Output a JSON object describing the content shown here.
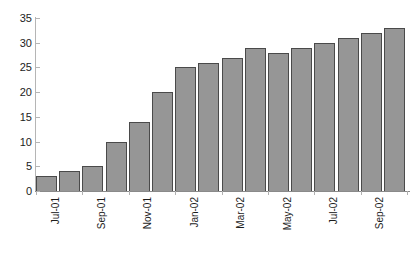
{
  "chart_data": {
    "type": "bar",
    "title": "",
    "subtitle": "",
    "xlabel": "",
    "ylabel": "",
    "categories": [
      "Jul-01",
      "Aug-01",
      "Sep-01",
      "Oct-01",
      "Nov-01",
      "Dec-01",
      "Jan-02",
      "Feb-02",
      "Mar-02",
      "Apr-02",
      "May-02",
      "Jun-02",
      "Jul-02",
      "Aug-02",
      "Sep-02",
      "Oct-02"
    ],
    "values": [
      3,
      4,
      5,
      10,
      14,
      20,
      25,
      26,
      27,
      29,
      28,
      29,
      30,
      31,
      32,
      33
    ],
    "tick_labels": [
      "Jul-01",
      "Sep-01",
      "Nov-01",
      "Jan-02",
      "Mar-02",
      "May-02",
      "Jul-02",
      "Sep-02"
    ],
    "tick_label_indices": [
      0,
      2,
      4,
      6,
      8,
      10,
      12,
      14
    ],
    "ylim": [
      0,
      35
    ],
    "yticks": [
      0,
      5,
      10,
      15,
      20,
      25,
      30,
      35
    ],
    "ytick_labels": [
      "0",
      "5",
      "10",
      "15",
      "20",
      "25",
      "30",
      "35"
    ],
    "grid": false,
    "legend": null,
    "legend_position": "none",
    "bar_color": "#969696",
    "bar_border_color": "#4a4a4a",
    "axis_color": "#b5b5b5",
    "baseline_color": "#8a8a8a",
    "text_color": "#1c1c1c",
    "background": "#ffffff",
    "annotations": []
  },
  "caption": {
    "text": ""
  }
}
